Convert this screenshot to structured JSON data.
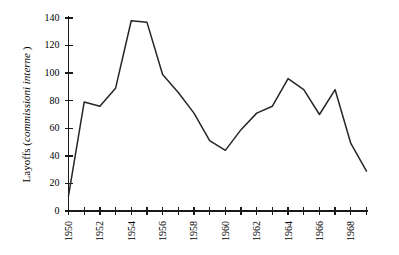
{
  "chart_data": {
    "type": "line",
    "title": "",
    "xlabel": "",
    "ylabel": "Layoffs (commissioni interne)",
    "ylabel_plain": "Layoffs (",
    "ylabel_italic": "commissioni interne",
    "ylabel_close": " )",
    "xlim": [
      1950,
      1969
    ],
    "ylim": [
      0,
      140
    ],
    "grid": false,
    "legend": false,
    "y_ticks": [
      0,
      20,
      40,
      60,
      80,
      100,
      120,
      140
    ],
    "y_tick_labels": [
      "0",
      "20",
      "40",
      "60",
      "80",
      "100",
      "120",
      "140"
    ],
    "x_ticks": [
      1950,
      1951,
      1952,
      1953,
      1954,
      1955,
      1956,
      1957,
      1958,
      1959,
      1960,
      1961,
      1962,
      1963,
      1964,
      1965,
      1966,
      1967,
      1968,
      1969
    ],
    "x_tick_labels": [
      "1950",
      "",
      "1952",
      "",
      "1954",
      "",
      "1956",
      "",
      "1958",
      "",
      "1960",
      "",
      "1962",
      "",
      "1964",
      "",
      "1966",
      "",
      "1968",
      ""
    ],
    "x_labeled_ticks": [
      1950,
      1952,
      1954,
      1956,
      1958,
      1960,
      1962,
      1964,
      1966,
      1968
    ],
    "series": [
      {
        "name": "Layoffs (commissioni interne)",
        "color": "#262626",
        "x": [
          1950,
          1951,
          1952,
          1953,
          1954,
          1955,
          1956,
          1957,
          1958,
          1959,
          1960,
          1961,
          1962,
          1963,
          1964,
          1965,
          1966,
          1967,
          1968,
          1969
        ],
        "values": [
          11,
          79,
          76,
          89,
          138,
          137,
          99,
          86,
          71,
          51,
          44,
          59,
          71,
          76,
          96,
          88,
          70,
          88,
          49,
          29
        ]
      }
    ]
  },
  "axes": {
    "y_axis_name": "y-axis",
    "x_axis_name": "x-axis"
  }
}
